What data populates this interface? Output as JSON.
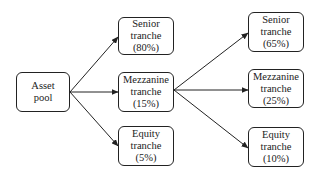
{
  "diagram": {
    "type": "flowchart",
    "nodes": [
      {
        "id": "asset_pool",
        "lines": [
          "Asset",
          "pool"
        ],
        "x": 16,
        "y": 72,
        "w": 54,
        "h": 40
      },
      {
        "id": "senior_1",
        "lines": [
          "Senior",
          "tranche",
          "(80%)"
        ],
        "x": 118,
        "y": 17,
        "w": 56,
        "h": 38
      },
      {
        "id": "mezzanine_1",
        "lines": [
          "Mezzanine",
          "tranche",
          "(15%)"
        ],
        "x": 118,
        "y": 72,
        "w": 56,
        "h": 40
      },
      {
        "id": "equity_1",
        "lines": [
          "Equity",
          "tranche",
          "(5%)"
        ],
        "x": 118,
        "y": 126,
        "w": 56,
        "h": 40
      },
      {
        "id": "senior_2",
        "lines": [
          "Senior",
          "tranche",
          "(65%)"
        ],
        "x": 248,
        "y": 12,
        "w": 56,
        "h": 40
      },
      {
        "id": "mezzanine_2",
        "lines": [
          "Mezzanine",
          "tranche",
          "(25%)"
        ],
        "x": 248,
        "y": 69,
        "w": 56,
        "h": 39
      },
      {
        "id": "equity_2",
        "lines": [
          "Equity",
          "tranche",
          "(10%)"
        ],
        "x": 248,
        "y": 127,
        "w": 56,
        "h": 40
      }
    ],
    "edges": [
      {
        "from": "asset_pool",
        "to": "senior_1"
      },
      {
        "from": "asset_pool",
        "to": "mezzanine_1"
      },
      {
        "from": "asset_pool",
        "to": "equity_1"
      },
      {
        "from": "mezzanine_1",
        "to": "senior_2"
      },
      {
        "from": "mezzanine_1",
        "to": "mezzanine_2"
      },
      {
        "from": "mezzanine_1",
        "to": "equity_2"
      }
    ],
    "colors": {
      "stroke": "#222222",
      "background": "#ffffff",
      "text": "#222222"
    }
  }
}
